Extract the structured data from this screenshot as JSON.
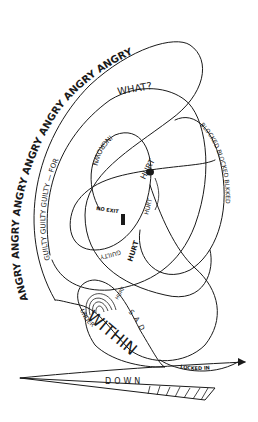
{
  "illustration": {
    "background": "#ffffff",
    "ink_color": "#1a1a1a",
    "labels": {
      "angry_outer": "ANGRY ANGRY ANGRY ANGRY ANGRY ANGRY ANGRY",
      "angry_top": "ANGRY ANGRY ANGRY ANGRY",
      "angry_right": "ANGRY",
      "guilty_arc": "GUILTY GUILTY GUILTY — FOR",
      "what": "WHAT?",
      "guilty_lower": "GUILTY",
      "ingrown": "INGROWN",
      "hurt_top": "HURT",
      "hurt_mid": "HURT",
      "hurt_lower": "HURT",
      "hurt_bottom": "HURT",
      "no_exit": "NO EXIT",
      "blocked": "BLOCKED BLOCKED BLKKED",
      "sad": "SAD",
      "within": "WITHIN",
      "under": "UNDER",
      "locked_in": "LOCKED IN",
      "down": "DOWN"
    }
  }
}
